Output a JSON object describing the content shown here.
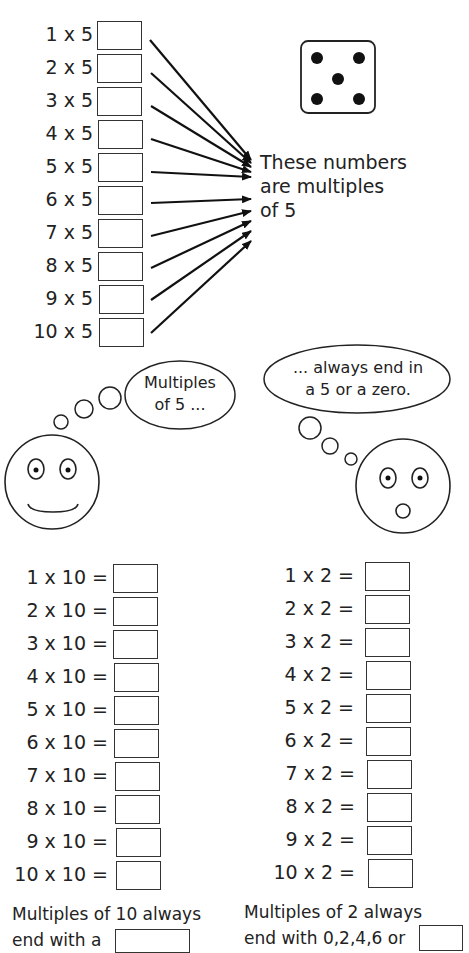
{
  "section_fives": {
    "equations": [
      "1 x 5 =",
      "2 x 5 =",
      "3 x 5 =",
      "4 x 5 =",
      "5 x 5 =",
      "6 x 5 =",
      "7 x 5 =",
      "8 x 5 =",
      "9 x 5 =",
      "10 x 5 ="
    ],
    "note_line1": "These numbers",
    "note_line2": "are multiples",
    "note_line3": "of 5",
    "die_value": 5
  },
  "thought_left": {
    "line1": "Multiples",
    "line2": "of 5 ..."
  },
  "thought_right": {
    "line1": "... always end in",
    "line2": "a 5 or a zero."
  },
  "section_tens": {
    "equations": [
      "1 x 10 =",
      "2 x 10 =",
      "3 x 10 =",
      "4 x 10 =",
      "5 x 10 =",
      "6 x 10 =",
      "7 x 10 =",
      "8 x 10 =",
      "9 x 10 =",
      "10 x 10 ="
    ],
    "footer_line1": "Multiples of 10 always",
    "footer_line2": "end with a"
  },
  "section_twos": {
    "equations": [
      "1 x 2 =",
      "2 x 2 =",
      "3 x 2 =",
      "4 x 2 =",
      "5 x 2 =",
      "6 x 2 =",
      "7 x 2 =",
      "8 x 2 =",
      "9 x 2 =",
      "10 x 2 ="
    ],
    "footer_line1": "Multiples of 2 always",
    "footer_line2": "end with 0,2,4,6 or"
  }
}
